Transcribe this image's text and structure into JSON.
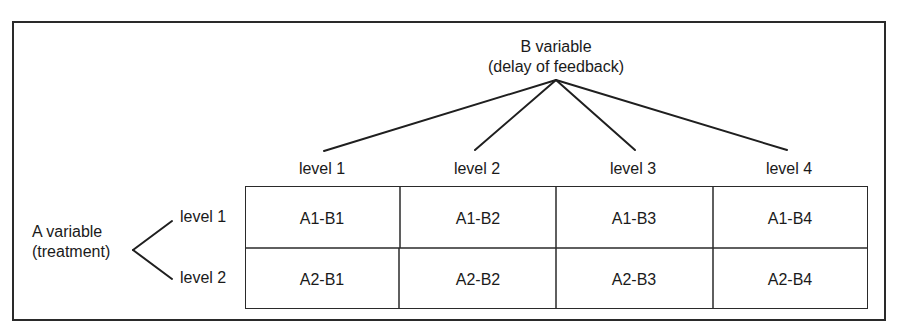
{
  "b_variable": {
    "name": "B variable",
    "description": "(delay of feedback)",
    "levels": [
      "level 1",
      "level 2",
      "level 3",
      "level 4"
    ]
  },
  "a_variable": {
    "name": "A variable",
    "description": "(treatment)",
    "levels": [
      "level 1",
      "level 2"
    ]
  },
  "cells": [
    [
      "A1-B1",
      "A1-B2",
      "A1-B3",
      "A1-B4"
    ],
    [
      "A2-B1",
      "A2-B2",
      "A2-B3",
      "A2-B4"
    ]
  ]
}
